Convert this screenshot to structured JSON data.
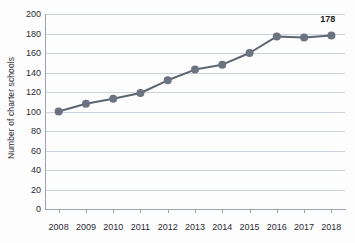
{
  "chart_data": {
    "type": "line",
    "title": "",
    "xlabel": "",
    "ylabel": "Number of charter schools",
    "categories": [
      "2008",
      "2009",
      "2010",
      "2011",
      "2012",
      "2013",
      "2014",
      "2015",
      "2016",
      "2017",
      "2018"
    ],
    "values": [
      100,
      108,
      113,
      119,
      132,
      143,
      148,
      160,
      177,
      176,
      178
    ],
    "series": [
      {
        "name": "Number of charter schools",
        "values": [
          100,
          108,
          113,
          119,
          132,
          143,
          148,
          160,
          177,
          176,
          178
        ]
      }
    ],
    "ylim": [
      0,
      200
    ],
    "ytick_labels": [
      "0",
      "20",
      "40",
      "60",
      "80",
      "100",
      "120",
      "140",
      "160",
      "180",
      "200"
    ],
    "ytick_values": [
      0,
      20,
      40,
      60,
      80,
      100,
      120,
      140,
      160,
      180,
      200
    ],
    "grid": true,
    "legend": "none",
    "annotations": [
      {
        "text": "178",
        "x": "2018",
        "y": 178
      }
    ],
    "colors": {
      "line": "#5d6573",
      "marker": "#6b7280",
      "grid": "#ccd2dc",
      "axis": "#9aa3b0",
      "text": "#2b2b33",
      "background": "#fdfdfd"
    }
  }
}
